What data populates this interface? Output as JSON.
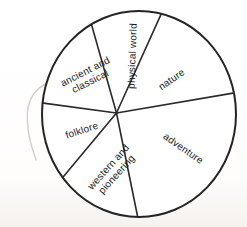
{
  "colors": {
    "ink": "#2a2a2a",
    "paper": "#ffffff",
    "pencil_mark": "#c9c6c2"
  },
  "chart_data": {
    "type": "pie",
    "title": "",
    "has_numeric_labels": false,
    "legend": "none",
    "categories": [
      "nature",
      "physical world",
      "ancient and classical",
      "folklore",
      "western and pioneering",
      "adventure"
    ],
    "values_pct": [
      15.6,
      11.1,
      18.5,
      16.1,
      14.3,
      24.5
    ],
    "values_deg": [
      56.0,
      40.1,
      66.5,
      57.8,
      51.4,
      88.2
    ],
    "segments": [
      {
        "label": "nature",
        "label_lines": [
          "nature"
        ],
        "start_angle_deg": 9.7,
        "sweep_deg": 56.0,
        "pct": 15.6
      },
      {
        "label": "physical world",
        "label_lines": [
          "physical world"
        ],
        "start_angle_deg": 65.7,
        "sweep_deg": 40.1,
        "pct": 11.1
      },
      {
        "label": "ancient and classical",
        "label_lines": [
          "ancient and",
          "classical"
        ],
        "start_angle_deg": 105.8,
        "sweep_deg": 66.5,
        "pct": 18.5
      },
      {
        "label": "folklore",
        "label_lines": [
          "folklore"
        ],
        "start_angle_deg": 172.3,
        "sweep_deg": 57.8,
        "pct": 16.1
      },
      {
        "label": "western and pioneering",
        "label_lines": [
          "western and",
          "pioneering"
        ],
        "start_angle_deg": 230.1,
        "sweep_deg": 51.4,
        "pct": 14.3
      },
      {
        "label": "adventure",
        "label_lines": [
          "adventure"
        ],
        "start_angle_deg": 281.5,
        "sweep_deg": 88.2,
        "pct": 24.5
      }
    ]
  }
}
